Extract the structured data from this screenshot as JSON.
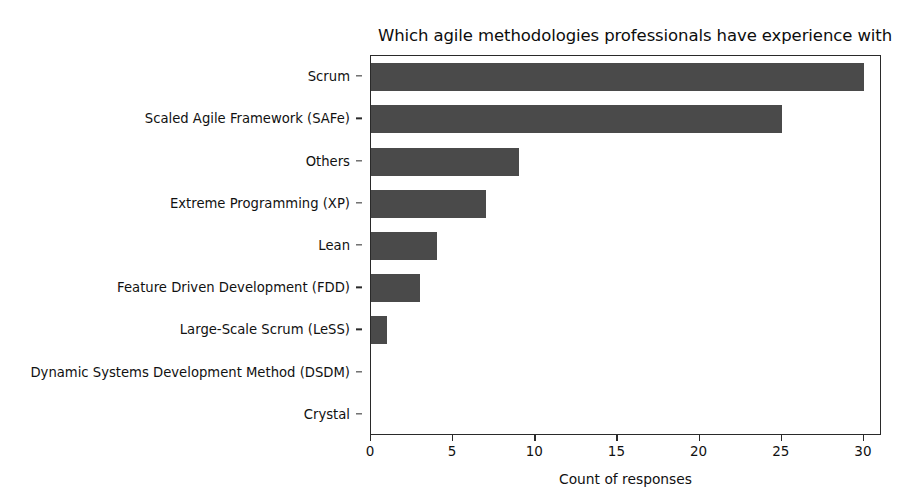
{
  "chart_data": {
    "type": "bar",
    "orientation": "horizontal",
    "title": "Which agile methodologies professionals have experience with",
    "xlabel": "Count of responses",
    "ylabel": "",
    "categories": [
      "Scrum",
      "Scaled Agile Framework (SAFe)",
      "Others",
      "Extreme Programming (XP)",
      "Lean",
      "Feature Driven Development (FDD)",
      "Large-Scale Scrum (LeSS)",
      "Dynamic Systems Development Method (DSDM)",
      "Crystal"
    ],
    "values": [
      30,
      25,
      9,
      7,
      4,
      3,
      1,
      0,
      0
    ],
    "xlim": [
      0,
      31.1
    ],
    "xticks": [
      0,
      5,
      10,
      15,
      20,
      25,
      30
    ],
    "xtick_labels": [
      "0",
      "5",
      "10",
      "15",
      "20",
      "25",
      "30"
    ],
    "grid": false,
    "legend": null,
    "bar_color": "#4a4a4a",
    "axis_color": "#2a2a2a",
    "background_color": "#ffffff"
  }
}
